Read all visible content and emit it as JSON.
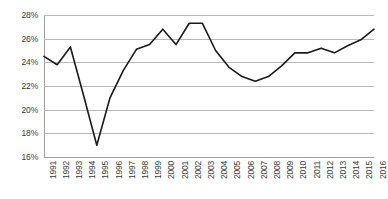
{
  "chart_data": {
    "type": "line",
    "title": "",
    "subtitle": "",
    "xlabel": "",
    "ylabel": "",
    "categories": [
      "1991",
      "1992",
      "1993",
      "1994",
      "1995",
      "1996",
      "1997",
      "1998",
      "1999",
      "2000",
      "2001",
      "2002",
      "2003",
      "2004",
      "2005",
      "2006",
      "2007",
      "2008",
      "2009",
      "2010",
      "2011",
      "2012",
      "2013",
      "2014",
      "2015",
      "2016"
    ],
    "x": [
      1991,
      1992,
      1993,
      1994,
      1995,
      1996,
      1997,
      1998,
      1999,
      2000,
      2001,
      2002,
      2003,
      2004,
      2005,
      2006,
      2007,
      2008,
      2009,
      2010,
      2011,
      2012,
      2013,
      2014,
      2015,
      2016
    ],
    "series": [
      {
        "name": "Series 1",
        "color": "#1a1a1a",
        "values": [
          24.5,
          23.8,
          25.3,
          21.2,
          17.0,
          21.0,
          23.3,
          25.1,
          25.5,
          26.8,
          25.5,
          27.3,
          27.3,
          25.0,
          23.6,
          22.8,
          22.4,
          22.8,
          23.7,
          24.8,
          24.8,
          25.2,
          24.8,
          25.4,
          25.9,
          26.8
        ]
      }
    ],
    "ylim": [
      16,
      28
    ],
    "ytick_step": 2,
    "ytick_labels": [
      "28%",
      "26%",
      "24%",
      "22%",
      "20%",
      "18%",
      "16%"
    ],
    "ytick_values": [
      28,
      26,
      24,
      22,
      20,
      18,
      16
    ],
    "grid": true,
    "grid_axis": "y",
    "grid_color": "#b9b9b9",
    "legend": false,
    "legend_position": "none",
    "line_width": 1.6,
    "markers": false,
    "background": "#ffffff",
    "plot_background": "#ffffff",
    "axis_color": "#9e9e9e",
    "tick_label_color": "#3a3a3a",
    "xtick_rotation": -90
  }
}
